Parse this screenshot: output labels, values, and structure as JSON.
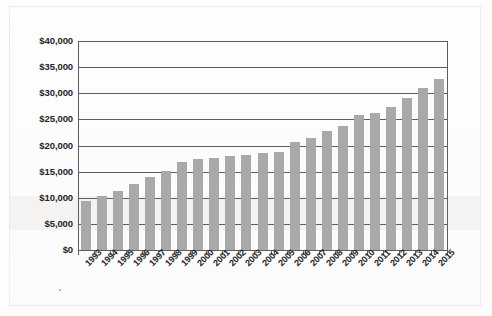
{
  "page": {
    "background_color": "#fdfdfd",
    "border_color": "#ececed"
  },
  "chart_data": {
    "type": "bar",
    "title": "",
    "subtitle": "",
    "xlabel": "",
    "ylabel": "",
    "grid": "horizontal",
    "legend": "none",
    "bar_color": "#a9a9a9",
    "axis_color": "#5d5d5f",
    "ylim": [
      0,
      40000
    ],
    "ytick_step": 5000,
    "ytick_labels": [
      "$0",
      "$5,000",
      "$10,000",
      "$15,000",
      "$20,000",
      "$25,000",
      "$30,000",
      "$35,000",
      "$40,000"
    ],
    "ytick_values": [
      0,
      5000,
      10000,
      15000,
      20000,
      25000,
      30000,
      35000,
      40000
    ],
    "categories": [
      "1993",
      "1994",
      "1995",
      "1996",
      "1997",
      "1998",
      "1999",
      "2000",
      "2001",
      "2002",
      "2003",
      "2004",
      "2005",
      "2006",
      "2007",
      "2008",
      "2009",
      "2010",
      "2011",
      "2012",
      "2013",
      "2014",
      "2015"
    ],
    "values": [
      9400,
      10300,
      11300,
      12600,
      13900,
      15200,
      16800,
      17400,
      17600,
      17900,
      18200,
      18500,
      18800,
      20600,
      21400,
      22700,
      23800,
      25800,
      26200,
      27400,
      29000,
      31000,
      32700
    ]
  }
}
